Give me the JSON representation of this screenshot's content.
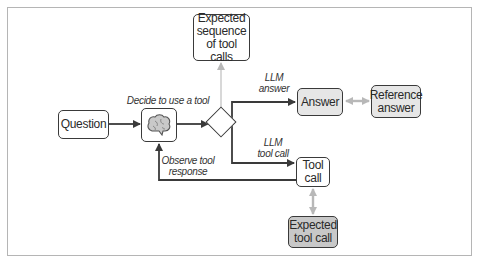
{
  "diagram": {
    "nodes": {
      "question": "Question",
      "llm": "brain-icon",
      "expected_sequence": "Expected sequence of tool calls",
      "answer": "Answer",
      "reference_answer": "Reference answer",
      "tool_call": "Tool call",
      "expected_tool_call": "Expected tool call"
    },
    "node_lines": {
      "expected_sequence": [
        "Expected",
        "sequence",
        "of tool calls"
      ],
      "reference_answer": [
        "Reference",
        "answer"
      ],
      "tool_call": [
        "Tool",
        "call"
      ],
      "expected_tool_call": [
        "Expected",
        "tool call"
      ]
    },
    "edge_labels": {
      "decide": "Decide to use a tool",
      "llm_answer_1": "LLM",
      "llm_answer_2": "answer",
      "llm_tool_1": "LLM",
      "llm_tool_2": "tool call",
      "observe_1": "Observe tool",
      "observe_2": "response"
    },
    "colors": {
      "stroke": "#3a3a3a",
      "comparison_arrow": "#b0b0b0",
      "light_fill": "#e6e6e6",
      "mid_fill": "#c8c8c8"
    }
  }
}
